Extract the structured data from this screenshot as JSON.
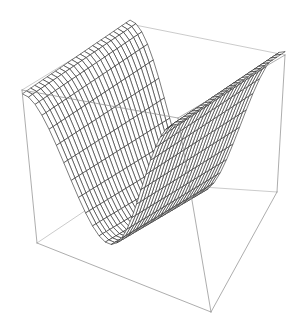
{
  "figure": {
    "kind": "3d-surface-wireframe",
    "title": "",
    "background_color": "#ffffff",
    "width": 307,
    "height": 334
  },
  "chart_data": {
    "type": "surface",
    "title": "",
    "xlabel": "",
    "ylabel": "",
    "zlabel": "",
    "surface_formula": "z = cos(x)",
    "xlim": [
      -3.14159,
      3.14159
    ],
    "ylim": [
      -3.14159,
      3.14159
    ],
    "zlim": [
      -1,
      1
    ],
    "grid_steps_u": 26,
    "grid_steps_v": 26,
    "grid": true,
    "axes_ticks": false,
    "axes_labels": false,
    "legend": false,
    "mesh_color": "#2b2b2b",
    "mesh_line_width": 0.62,
    "box_color": "#8a8a8a",
    "box_line_width": 0.7,
    "face_color": "#ffffff",
    "view": {
      "azimuth_deg": 38,
      "elevation_deg": 22,
      "projection": "perspective",
      "distance": 7.2
    },
    "box_corners_px": {
      "top_back": [
        130,
        24
      ],
      "top_left": [
        22,
        90
      ],
      "top_right": [
        285,
        55
      ],
      "top_front": [
        178,
        118
      ],
      "bottom_left": [
        37,
        243
      ],
      "bottom_right": [
        277,
        192
      ],
      "bottom_front": [
        211,
        312
      ],
      "bottom_back": [
        128,
        182
      ]
    },
    "surface_features": {
      "left_peak_px": [
        88,
        50
      ],
      "right_peak_px": [
        268,
        95
      ],
      "valley_center_px": [
        185,
        142
      ],
      "front_lip_px": [
        160,
        290
      ]
    }
  }
}
